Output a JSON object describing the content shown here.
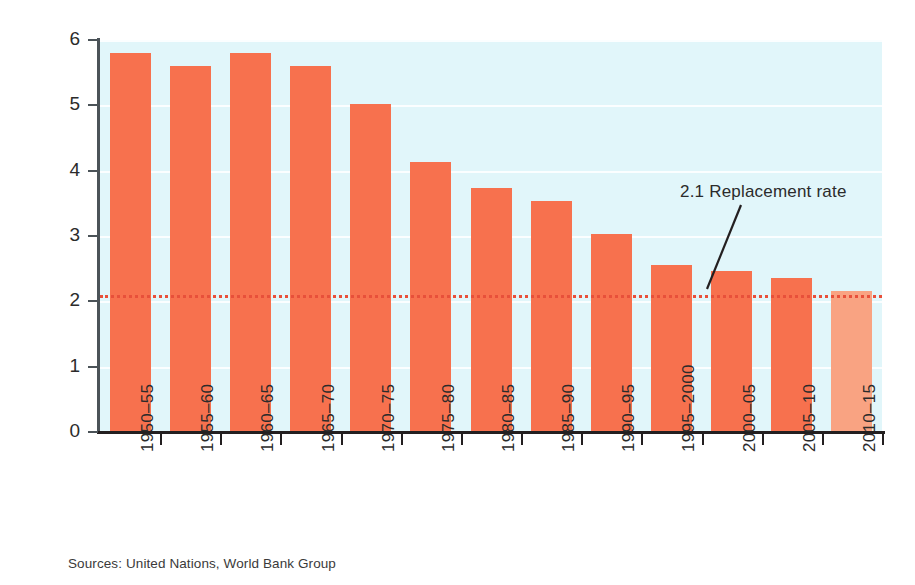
{
  "chart_data": {
    "type": "bar",
    "title": "",
    "xlabel": "",
    "ylabel": "Fertility rate",
    "ylim": [
      0,
      6
    ],
    "yticks": [
      0,
      1,
      2,
      3,
      4,
      5,
      6
    ],
    "grid": true,
    "legend": "none",
    "categories": [
      "1950–55",
      "1955–60",
      "1960–65",
      "1965–70",
      "1970–75",
      "1975–80",
      "1980–85",
      "1985–90",
      "1990–95",
      "1995–2000",
      "2000–05",
      "2005–10",
      "2010–15"
    ],
    "values": [
      5.8,
      5.6,
      5.8,
      5.6,
      5.02,
      4.13,
      3.74,
      3.54,
      3.03,
      2.55,
      2.46,
      2.35,
      2.16
    ],
    "bar_styles": [
      "solid",
      "solid",
      "solid",
      "solid",
      "solid",
      "solid",
      "solid",
      "solid",
      "solid",
      "solid",
      "solid",
      "solid",
      "projected"
    ],
    "reference_line": {
      "value": 2.1,
      "label": "2.1 Replacement rate",
      "style": "dotted",
      "color": "#e8503a"
    },
    "colors": {
      "bar": "#f7714e",
      "bar_projected": "#f9a382",
      "plot_background": "#e1f6fa",
      "axis": "#231f20",
      "gridline": "#ffffff",
      "text": "#2b2b2b"
    }
  },
  "axis": {
    "y_title": "Fertility rate",
    "y_tick_labels": [
      "6",
      "5",
      "4",
      "3",
      "2",
      "1",
      "0"
    ]
  },
  "annotation": {
    "replacement_label": "2.1 Replacement rate"
  },
  "footer": {
    "sources": "Sources: United Nations, World Bank Group"
  }
}
